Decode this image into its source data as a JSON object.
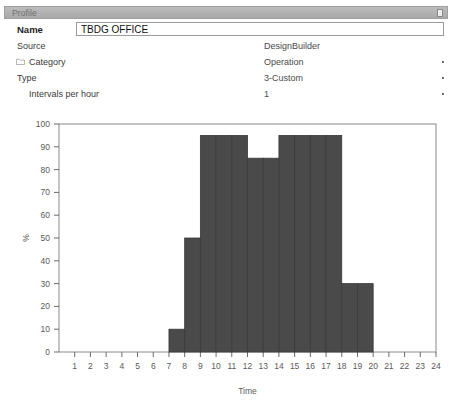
{
  "window": {
    "title": "Profile",
    "close_icon": "close-icon"
  },
  "form": {
    "fields": [
      {
        "label": "Name",
        "value": "TBDG OFFICE",
        "kind": "text-input"
      },
      {
        "label": "Source",
        "value": "DesignBuilder",
        "kind": "static"
      },
      {
        "label": "Category",
        "value": "Operation",
        "kind": "dropdown",
        "icon": "folder-icon"
      },
      {
        "label": "Type",
        "value": "3-Custom",
        "kind": "dropdown"
      },
      {
        "label": "Intervals per hour",
        "value": "1",
        "kind": "dropdown"
      }
    ]
  },
  "colors": {
    "bar": "#4a4a4a",
    "bar_edge": "#3a3a3a",
    "axis": "#6b6b6b",
    "plot_border": "#8a8a8a",
    "titlebar": "#b3b3b3"
  },
  "chart_data": {
    "type": "bar",
    "title": "",
    "xlabel": "Time",
    "ylabel": "%",
    "xlim": [
      0,
      24
    ],
    "ylim": [
      0,
      100
    ],
    "ytick_step": 10,
    "yticks": [
      0,
      10,
      20,
      30,
      40,
      50,
      60,
      70,
      80,
      90,
      100
    ],
    "xticks": [
      1,
      2,
      3,
      4,
      5,
      6,
      7,
      8,
      9,
      10,
      11,
      12,
      13,
      14,
      15,
      16,
      17,
      18,
      19,
      20,
      21,
      22,
      23,
      24
    ],
    "grid": false,
    "legend": "none",
    "categories": [
      1,
      2,
      3,
      4,
      5,
      6,
      7,
      8,
      9,
      10,
      11,
      12,
      13,
      14,
      15,
      16,
      17,
      18,
      19,
      20,
      21,
      22,
      23,
      24
    ],
    "values": [
      0,
      0,
      0,
      0,
      0,
      0,
      0,
      10,
      50,
      95,
      95,
      95,
      85,
      85,
      95,
      95,
      95,
      95,
      30,
      30,
      0,
      0,
      0,
      0
    ],
    "bar_align": "left-of-tick",
    "note": "Each bar spans from hour n-1 to hour n on the Time axis; first non-zero bar occupies 7-8."
  }
}
